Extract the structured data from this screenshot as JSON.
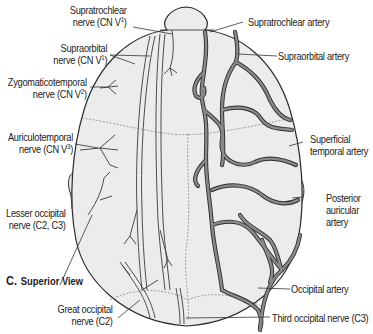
{
  "figure": {
    "view_letter": "C.",
    "view_title": "Superior View",
    "colors": {
      "background": "#ffffff",
      "scalp": "#ececec",
      "outline": "#2a2a2a",
      "artery_fill": "#8a8a8a",
      "artery_edge": "#2e2e2e",
      "nerve": "#3a3a3a",
      "suture": "#7a7a7a",
      "text": "#222222"
    }
  },
  "labels_left": [
    {
      "id": "supratrochlear-nerve",
      "line1": "Supratrochlear",
      "line2_prefix": "nerve (CN V",
      "sup": "1",
      "line2_suffix": ")"
    },
    {
      "id": "supraorbital-nerve",
      "line1": "Supraorbital",
      "line2_prefix": "nerve (CN V",
      "sup": "1",
      "line2_suffix": ")"
    },
    {
      "id": "zygomaticotemporal-nerve",
      "line1": "Zygomaticotemporal",
      "line2_prefix": "nerve (CN V",
      "sup": "2",
      "line2_suffix": ")"
    },
    {
      "id": "auriculotemporal-nerve",
      "line1": "Auriculotemporal",
      "line2_prefix": "nerve (CN V",
      "sup": "3",
      "line2_suffix": ")"
    },
    {
      "id": "lesser-occipital-nerve",
      "line1": "Lesser occipital",
      "line2_prefix": "nerve (C2, C3)",
      "sup": "",
      "line2_suffix": ""
    },
    {
      "id": "great-occipital-nerve",
      "line1": "Great occipital",
      "line2_prefix": "nerve (C2)",
      "sup": "",
      "line2_suffix": ""
    }
  ],
  "labels_right": [
    {
      "id": "supratrochlear-artery",
      "text": "Supratrochlear artery"
    },
    {
      "id": "supraorbital-artery",
      "text": "Supraorbital artery"
    },
    {
      "id": "superficial-temporal-artery",
      "line1": "Superficial",
      "line2": "temporal artery"
    },
    {
      "id": "posterior-auricular-artery",
      "line1": "Posterior",
      "line2": "auricular",
      "line3": "artery"
    },
    {
      "id": "occipital-artery",
      "text": "Occipital artery"
    },
    {
      "id": "third-occipital-nerve",
      "text": "Third occipital nerve (C3)"
    }
  ]
}
